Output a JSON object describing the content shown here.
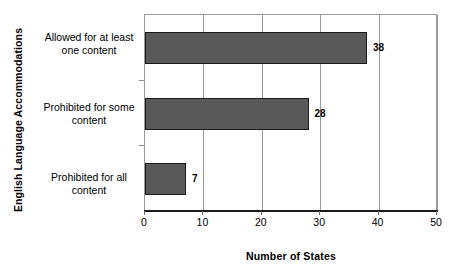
{
  "chart_data": {
    "type": "bar",
    "orientation": "horizontal",
    "title": "",
    "xlabel": "Number of States",
    "ylabel": "English Language Accommodations",
    "categories": [
      "Allowed for at least one content",
      "Prohibited for some content",
      "Prohibited for all content"
    ],
    "category_lines": [
      [
        "Allowed for at least",
        "one content"
      ],
      [
        "Prohibited for some",
        "content"
      ],
      [
        "Prohibited for all",
        "content"
      ]
    ],
    "values": [
      38,
      28,
      7
    ],
    "value_labels": [
      "38",
      "28",
      "7"
    ],
    "xlim": [
      0,
      50
    ],
    "xticks": [
      0,
      10,
      20,
      30,
      40,
      50
    ],
    "xtick_labels": [
      "0",
      "10",
      "20",
      "30",
      "40",
      "50"
    ],
    "grid": "vertical",
    "legend": "none",
    "colors": {
      "bar_fill": "#595959",
      "bar_border": "#1a1a1a",
      "gridline": "#9a9a9a",
      "axis": "#1a1a1a",
      "background": "#ffffff",
      "text": "#000000"
    }
  }
}
